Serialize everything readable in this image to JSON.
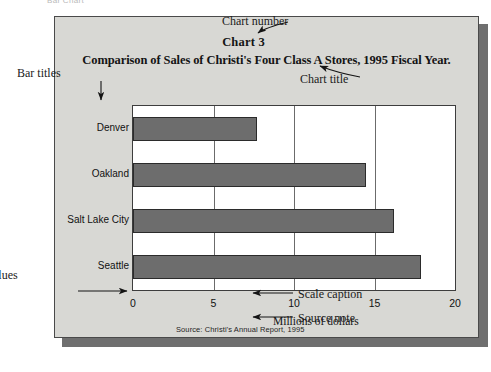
{
  "figure": {
    "top_caption": "Bar Chart",
    "chart_number": "Chart 3",
    "chart_title": "Comparison of Sales of Christi's Four Class A Stores, 1995 Fiscal Year.",
    "source_note": "Source: Christi's Annual Report, 1995"
  },
  "annotations": {
    "chart_number": "Chart number",
    "chart_title": "Chart title",
    "bar_titles": "Bar titles",
    "scale_values": "Scale values",
    "scale_caption": "Scale caption",
    "source_note": "Source note"
  },
  "colors": {
    "panel_background": "#d8d8d4",
    "panel_border": "#4a4a4a",
    "plot_background": "#ffffff",
    "bar_fill": "#6d6d6d",
    "bar_border": "#2b2b2b",
    "gridline": "#6b6b6b",
    "shadow": "#6f6f6f",
    "text": "#141414"
  },
  "chart_data": {
    "type": "bar",
    "orientation": "horizontal",
    "title": "Comparison of Sales of Christi's Four Class A Stores, 1995 Fiscal Year.",
    "subtitle": "Chart 3",
    "categories": [
      "Denver",
      "Oakland",
      "Salt Lake City",
      "Seattle"
    ],
    "values": [
      7.7,
      14.5,
      16.2,
      17.9
    ],
    "xlabel": "Millions of dollars",
    "ylabel": "",
    "xlim": [
      0,
      20
    ],
    "xticks": [
      0,
      5,
      10,
      15,
      20
    ],
    "xtick_labels": [
      "0",
      "5",
      "10",
      "15",
      "20"
    ],
    "grid": "vertical",
    "legend": "none",
    "source": "Source: Christi's Annual Report, 1995"
  }
}
